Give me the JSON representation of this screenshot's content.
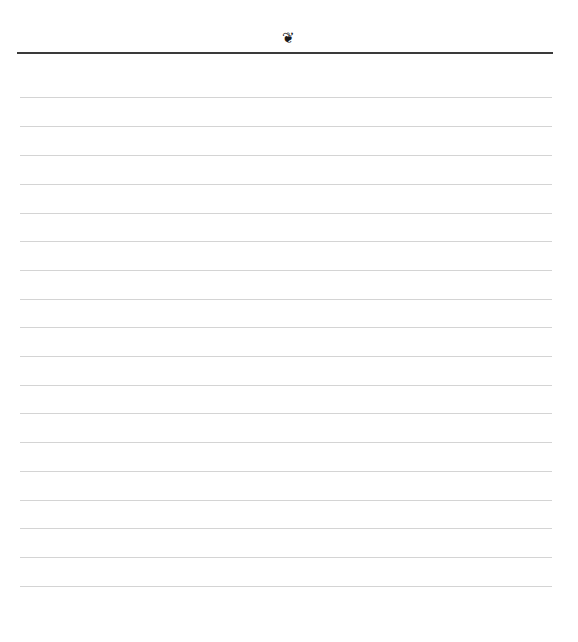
{
  "page": {
    "ornament": {
      "icon": "fleuron-icon",
      "glyph": "❦"
    },
    "header_rule": {
      "color": "#3a3a3a"
    },
    "ruled_lines": {
      "count": 18,
      "color": "#d4d4d4",
      "positions_y": [
        97,
        126,
        155,
        184,
        213,
        241,
        270,
        299,
        327,
        356,
        385,
        413,
        442,
        471,
        500,
        528,
        557,
        586
      ]
    }
  }
}
